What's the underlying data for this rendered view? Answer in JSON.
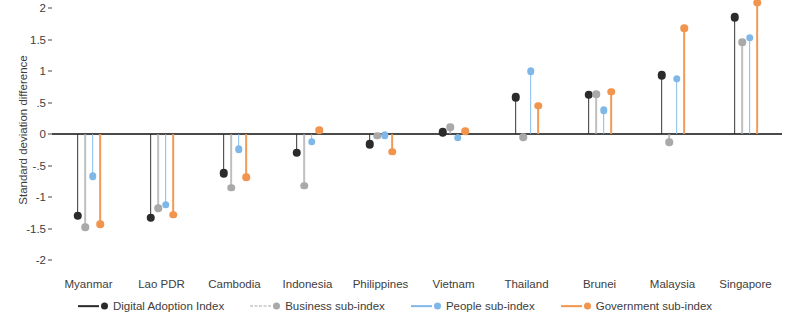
{
  "chart_data": {
    "type": "scatter",
    "title": "",
    "xlabel": "",
    "ylabel": "Standard deviation difference",
    "ylim": [
      -2,
      2
    ],
    "yticks": [
      2,
      1.5,
      1,
      0.5,
      0,
      -0.5,
      -1,
      -1.5,
      -2
    ],
    "ytick_labels": [
      "2",
      "1.5",
      "1",
      ".5",
      "0",
      "-.5",
      "-1",
      "-1.5",
      "-2"
    ],
    "grid": false,
    "legend_position": "bottom",
    "categories": [
      "Myanmar",
      "Lao PDR",
      "Cambodia",
      "Indonesia",
      "Philippines",
      "Vietnam",
      "Thailand",
      "Brunei",
      "Malaysia",
      "Singapore"
    ],
    "series": [
      {
        "name": "Digital Adoption Index",
        "color": "#2b2b2b",
        "values": [
          -1.3,
          -1.33,
          -0.62,
          -0.3,
          -0.16,
          0.03,
          0.58,
          0.62,
          0.93,
          1.85
        ]
      },
      {
        "name": "Business sub-index",
        "color": "#a9a9a9",
        "values": [
          -1.48,
          -1.18,
          -0.85,
          -0.82,
          -0.03,
          0.11,
          -0.05,
          0.63,
          -0.13,
          1.46
        ]
      },
      {
        "name": "People sub-index",
        "color": "#7fb8e8",
        "values": [
          -0.67,
          -1.12,
          -0.24,
          -0.12,
          -0.02,
          -0.06,
          1.0,
          0.38,
          0.88,
          1.53
        ]
      },
      {
        "name": "Government sub-index",
        "color": "#f1954e",
        "values": [
          -1.43,
          -1.28,
          -0.69,
          0.06,
          -0.28,
          0.04,
          0.45,
          0.67,
          1.68,
          2.08
        ]
      }
    ]
  },
  "legend": {
    "items": [
      {
        "label": "Digital Adoption Index"
      },
      {
        "label": "Business sub-index"
      },
      {
        "label": "People sub-index"
      },
      {
        "label": "Government sub-index"
      }
    ]
  }
}
